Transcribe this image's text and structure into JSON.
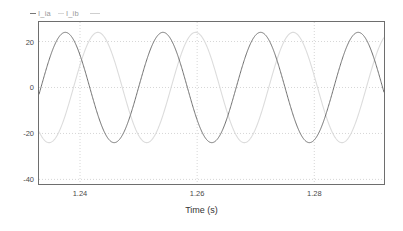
{
  "chart_data": {
    "type": "line",
    "title": "",
    "xlabel": "Time (s)",
    "ylabel": "",
    "xlim": [
      1.233,
      1.2919
    ],
    "ylim": [
      -42.0,
      28.5
    ],
    "xticks": [
      1.24,
      1.26,
      1.28
    ],
    "xtick_labels": [
      "1.24",
      "1.26",
      "1.28"
    ],
    "yticks": [
      20,
      0,
      -20,
      -40
    ],
    "ytick_labels": [
      "20",
      "0",
      "-20",
      "-40"
    ],
    "grid": "dotted",
    "legend_position": "above-top-left",
    "series": [
      {
        "name": "I_ia",
        "color": "#707070",
        "waveform": "sine",
        "amplitude": 24.0,
        "frequency_hz": 60.0,
        "phase_deg": 0.0,
        "offset": 0.0,
        "peak": 23.5,
        "trough": -24.5
      },
      {
        "name": "I_ib",
        "color": "#dcdcdc",
        "waveform": "sine",
        "amplitude": 24.0,
        "frequency_hz": 60.0,
        "phase_deg": -120.0,
        "offset": 0.0,
        "peak": 23.5,
        "trough": -24.5
      }
    ]
  },
  "legend": {
    "entries": [
      {
        "label": "I_ia"
      },
      {
        "label": "I_ib"
      }
    ]
  },
  "axes": {
    "xlabel": "Time (s)",
    "xtick_labels": [
      "1.24",
      "1.26",
      "1.28"
    ],
    "ytick_labels": [
      "20",
      "0",
      "-20",
      "-40"
    ]
  },
  "colors": {
    "series_a": "#707070",
    "series_b": "#dcdcdc",
    "frame": "#6e6e6e",
    "grid": "#cccccc",
    "text": "#4a4a4a",
    "background": "#ffffff"
  }
}
